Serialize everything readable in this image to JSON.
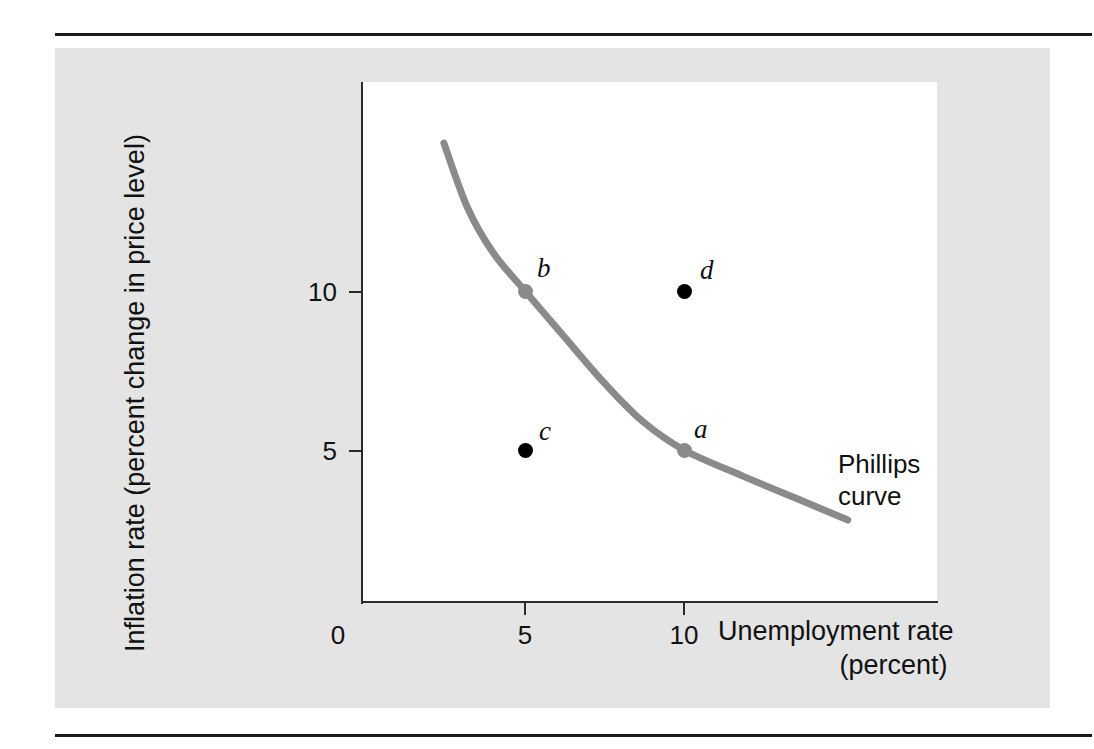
{
  "figure": {
    "background_color": "#ffffff",
    "panel_color": "#e4e4e4",
    "rule_color": "#1a1a1a"
  },
  "chart_data": {
    "type": "scatter",
    "title": "",
    "xlabel_line1": "Unemployment rate",
    "xlabel_line2": "(percent)",
    "ylabel": "Inflation rate (percent change in price level)",
    "xlim": [
      0,
      18
    ],
    "ylim": [
      0,
      16
    ],
    "xticks": [
      0,
      5,
      10
    ],
    "xticklabels": [
      "0",
      "5",
      "10"
    ],
    "yticks": [
      5,
      10
    ],
    "yticklabels": [
      "5",
      "10"
    ],
    "grid": false,
    "legend": "none",
    "annotations": [
      {
        "text_line1": "Phillips",
        "text_line2": "curve",
        "x": 15.0,
        "y": 4.1
      }
    ],
    "series": [
      {
        "name": "Phillips curve",
        "type": "line",
        "color": "#8a8a8a",
        "points": [
          {
            "x": 2.45,
            "y": 14.65
          },
          {
            "x": 3.2,
            "y": 12.6
          },
          {
            "x": 4.0,
            "y": 11.2
          },
          {
            "x": 5.0,
            "y": 10.0
          },
          {
            "x": 6.2,
            "y": 8.6
          },
          {
            "x": 7.5,
            "y": 7.1
          },
          {
            "x": 8.7,
            "y": 5.9
          },
          {
            "x": 10.0,
            "y": 5.0
          },
          {
            "x": 11.8,
            "y": 4.2
          },
          {
            "x": 13.6,
            "y": 3.45
          },
          {
            "x": 15.15,
            "y": 2.8
          }
        ]
      },
      {
        "name": "points on curve",
        "type": "scatter",
        "color": "#8a8a8a",
        "points": [
          {
            "label": "a",
            "x": 10,
            "y": 5,
            "label_dx": 10,
            "label_dy": -34
          },
          {
            "label": "b",
            "x": 5,
            "y": 10,
            "label_dx": 12,
            "label_dy": -36
          }
        ]
      },
      {
        "name": "points off curve",
        "type": "scatter",
        "color": "#000000",
        "points": [
          {
            "label": "c",
            "x": 5,
            "y": 5,
            "label_dx": 14,
            "label_dy": -32
          },
          {
            "label": "d",
            "x": 10,
            "y": 10,
            "label_dx": 16,
            "label_dy": -34
          }
        ]
      }
    ]
  },
  "axes": {
    "y_tick_10_label": "10",
    "y_tick_5_label": "5",
    "x_tick_0_label": "0",
    "x_tick_5_label": "5",
    "x_tick_10_label": "10",
    "ylabel_text": "Inflation rate (percent change in price level)",
    "xlabel_line1": "Unemployment rate",
    "xlabel_line2": "(percent)"
  },
  "curve_annotation": {
    "line1": "Phillips",
    "line2": "curve"
  },
  "point_labels": {
    "a": "a",
    "b": "b",
    "c": "c",
    "d": "d"
  }
}
